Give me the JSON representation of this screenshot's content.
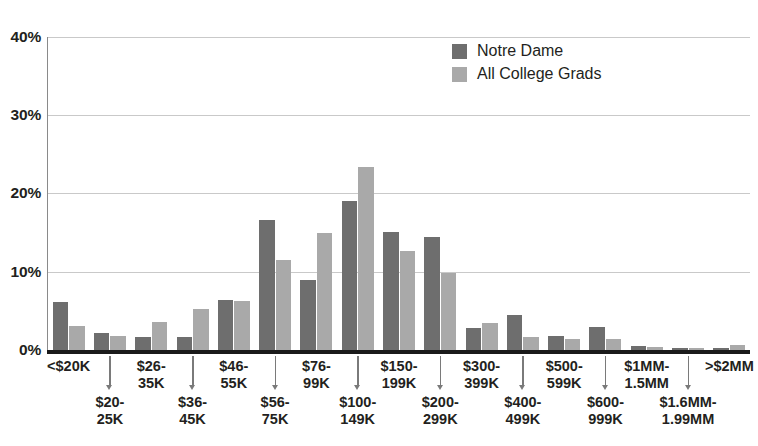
{
  "chart_data": {
    "type": "bar",
    "title": "",
    "subtitle": "",
    "xlabel": "",
    "ylabel": "",
    "ylim": [
      0,
      40
    ],
    "ytick_labels": [
      "0%",
      "10%",
      "20%",
      "30%",
      "40%"
    ],
    "ytick_values": [
      0,
      10,
      20,
      30,
      40
    ],
    "grid": true,
    "legend_position": "top-right",
    "categories": [
      "<$20K",
      "$20-\n25K",
      "$26-\n35K",
      "$36-\n45K",
      "$46-\n55K",
      "$56-\n75K",
      "$76-\n99K",
      "$100-\n149K",
      "$150-\n199K",
      "$200-\n299K",
      "$300-\n399K",
      "$400-\n499K",
      "$500-\n599K",
      "$600-\n999K",
      "$1MM-\n1.5MM",
      "$1.6MM-\n1.99MM",
      ">$2MM"
    ],
    "series": [
      {
        "name": "Notre Dame",
        "color": "#6e6e6e",
        "values": [
          6.1,
          2.2,
          1.7,
          1.6,
          6.4,
          16.6,
          8.9,
          19.0,
          15.1,
          14.5,
          2.8,
          4.5,
          1.8,
          3.0,
          0.5,
          0.3,
          0.3
        ]
      },
      {
        "name": "All College Grads",
        "color": "#a9a9a9",
        "values": [
          3.1,
          1.8,
          3.6,
          5.2,
          6.2,
          11.5,
          15.0,
          23.4,
          12.7,
          9.9,
          3.4,
          1.7,
          1.4,
          1.4,
          0.4,
          0.3,
          0.6
        ]
      }
    ]
  },
  "legend": {
    "items": [
      {
        "label": "Notre Dame",
        "color": "#6e6e6e"
      },
      {
        "label": "All College Grads",
        "color": "#a9a9a9"
      }
    ]
  },
  "colors": {
    "notre_dame": "#6e6e6e",
    "all_college_grads": "#a9a9a9",
    "gridline": "#c9c9c9",
    "axis": "#1a1a1a",
    "text": "#231f20",
    "background": "#ffffff"
  }
}
